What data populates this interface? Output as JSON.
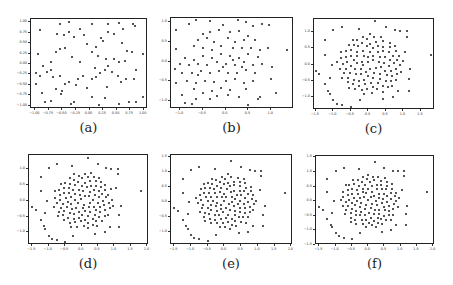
{
  "chart_data": [
    {
      "id": "a",
      "caption": "(a)",
      "type": "scatter",
      "box": {
        "left": 30,
        "top": 18,
        "right": 147,
        "bottom": 108
      },
      "xlim": [
        -1.08,
        1.08
      ],
      "ylim": [
        -1.08,
        1.08
      ],
      "xticks": [
        -1.0,
        -0.75,
        -0.5,
        -0.25,
        0.0,
        0.25,
        0.5,
        0.75,
        1.0
      ],
      "xtick_labels": [
        "−1.00",
        "−0.75",
        "−0.50",
        "−0.25",
        "0.00",
        "0.25",
        "0.50",
        "0.75",
        "1.00"
      ],
      "yticks": [
        1.0,
        0.75,
        0.5,
        0.25,
        0.0,
        -0.25,
        -0.5,
        -0.75,
        -1.0
      ],
      "ytick_labels": [
        "1.00",
        "0.75",
        "0.50",
        "0.25",
        "0.00",
        "−0.25",
        "−0.50",
        "−0.75",
        "−1.00"
      ],
      "points": [
        [
          -0.92,
          0.82
        ],
        [
          -0.55,
          0.95
        ],
        [
          -0.38,
          1.0
        ],
        [
          -0.18,
          0.83
        ],
        [
          0.05,
          0.97
        ],
        [
          0.35,
          0.97
        ],
        [
          0.55,
          0.98
        ],
        [
          0.62,
          0.84
        ],
        [
          0.8,
          0.95
        ],
        [
          0.84,
          0.92
        ],
        [
          -0.6,
          0.72
        ],
        [
          -0.48,
          0.7
        ],
        [
          -0.38,
          0.78
        ],
        [
          -0.28,
          0.65
        ],
        [
          -0.05,
          0.48
        ],
        [
          0.12,
          0.42
        ],
        [
          0.25,
          0.55
        ],
        [
          0.35,
          0.78
        ],
        [
          0.45,
          0.72
        ],
        [
          0.6,
          0.5
        ],
        [
          0.7,
          0.32
        ],
        [
          -0.95,
          0.25
        ],
        [
          -0.62,
          0.3
        ],
        [
          -0.55,
          0.35
        ],
        [
          -0.45,
          0.38
        ],
        [
          -0.32,
          0.18
        ],
        [
          -0.18,
          0.05
        ],
        [
          0.05,
          0.28
        ],
        [
          0.15,
          0.2
        ],
        [
          0.3,
          0.12
        ],
        [
          0.45,
          0.12
        ],
        [
          0.55,
          0.05
        ],
        [
          0.65,
          0.08
        ],
        [
          0.78,
          0.28
        ],
        [
          0.98,
          0.25
        ],
        [
          -0.98,
          -0.22
        ],
        [
          -0.92,
          -0.28
        ],
        [
          -0.85,
          -0.05
        ],
        [
          -0.78,
          -0.2
        ],
        [
          -0.72,
          -0.15
        ],
        [
          -0.68,
          -0.32
        ],
        [
          -0.55,
          -0.28
        ],
        [
          -0.45,
          -0.48
        ],
        [
          -0.38,
          -0.42
        ],
        [
          -0.22,
          -0.35
        ],
        [
          -0.12,
          -0.28
        ],
        [
          0.05,
          -0.35
        ],
        [
          0.12,
          -0.3
        ],
        [
          0.2,
          -0.22
        ],
        [
          0.28,
          -0.15
        ],
        [
          0.35,
          -0.05
        ],
        [
          0.42,
          -0.18
        ],
        [
          0.52,
          -0.28
        ],
        [
          0.58,
          -0.42
        ],
        [
          0.68,
          -0.35
        ],
        [
          0.82,
          -0.35
        ],
        [
          -0.98,
          -0.48
        ],
        [
          -0.88,
          -0.7
        ],
        [
          -0.82,
          -0.92
        ],
        [
          -0.72,
          -0.88
        ],
        [
          -0.62,
          -0.6
        ],
        [
          -0.52,
          -0.72
        ],
        [
          -0.35,
          -0.95
        ],
        [
          -0.28,
          -0.9
        ],
        [
          -0.05,
          -0.58
        ],
        [
          0.05,
          -0.78
        ],
        [
          0.18,
          -0.98
        ],
        [
          0.28,
          -0.82
        ],
        [
          0.32,
          -0.55
        ],
        [
          0.55,
          -0.95
        ],
        [
          0.72,
          -0.92
        ],
        [
          0.85,
          -0.9
        ],
        [
          0.98,
          -0.78
        ],
        [
          -0.5,
          -0.65
        ],
        [
          -0.25,
          -0.5
        ],
        [
          0.1,
          -0.1
        ],
        [
          0.22,
          0.62
        ],
        [
          -0.1,
          0.7
        ],
        [
          -0.72,
          0.05
        ],
        [
          0.85,
          -0.15
        ]
      ]
    },
    {
      "id": "b",
      "caption": "(b)",
      "type": "scatter",
      "box": {
        "left": 170,
        "top": 17,
        "right": 293,
        "bottom": 108
      },
      "xlim": [
        -1.2,
        1.5
      ],
      "ylim": [
        -1.2,
        1.1
      ],
      "xticks": [
        -1.0,
        -0.5,
        0.0,
        0.5,
        1.0
      ],
      "xtick_labels": [
        "−1.0",
        "−0.5",
        "0.0",
        "0.5",
        "1.0"
      ],
      "yticks": [
        1.0,
        0.5,
        0.0,
        -0.5,
        -1.0
      ],
      "ytick_labels": [
        "1.0",
        "0.5",
        "0.0",
        "−0.5",
        "−1.0"
      ],
      "points": [
        [
          -1.1,
          0.8
        ],
        [
          -0.8,
          0.95
        ],
        [
          -0.65,
          1.05
        ],
        [
          -0.35,
          1.02
        ],
        [
          -0.05,
          0.92
        ],
        [
          0.28,
          1.05
        ],
        [
          0.45,
          1.0
        ],
        [
          0.6,
          0.9
        ],
        [
          0.8,
          0.95
        ],
        [
          0.95,
          0.92
        ],
        [
          -0.5,
          0.7
        ],
        [
          -0.35,
          0.75
        ],
        [
          -0.15,
          0.8
        ],
        [
          0.1,
          0.75
        ],
        [
          0.3,
          0.78
        ],
        [
          0.5,
          0.65
        ],
        [
          -0.6,
          0.55
        ],
        [
          -0.4,
          0.6
        ],
        [
          -0.25,
          0.5
        ],
        [
          0.05,
          0.6
        ],
        [
          0.2,
          0.5
        ],
        [
          0.4,
          0.55
        ],
        [
          0.65,
          0.55
        ],
        [
          -1.1,
          0.32
        ],
        [
          -0.7,
          0.4
        ],
        [
          -0.5,
          0.35
        ],
        [
          -0.3,
          0.3
        ],
        [
          -0.1,
          0.4
        ],
        [
          0.15,
          0.35
        ],
        [
          0.35,
          0.35
        ],
        [
          0.55,
          0.35
        ],
        [
          0.75,
          0.3
        ],
        [
          0.92,
          0.35
        ],
        [
          1.35,
          0.28
        ],
        [
          -0.9,
          0.1
        ],
        [
          -0.7,
          0.05
        ],
        [
          -0.5,
          0.15
        ],
        [
          -0.3,
          0.1
        ],
        [
          -0.1,
          0.18
        ],
        [
          0.1,
          0.15
        ],
        [
          0.3,
          0.1
        ],
        [
          0.5,
          0.18
        ],
        [
          0.7,
          0.12
        ],
        [
          -1.0,
          -0.05
        ],
        [
          -0.8,
          -0.1
        ],
        [
          -0.6,
          -0.05
        ],
        [
          -0.4,
          -0.1
        ],
        [
          -0.2,
          -0.02
        ],
        [
          0.0,
          -0.05
        ],
        [
          0.2,
          -0.08
        ],
        [
          0.4,
          -0.02
        ],
        [
          0.6,
          -0.1
        ],
        [
          0.8,
          -0.05
        ],
        [
          -1.12,
          -0.2
        ],
        [
          -0.95,
          -0.3
        ],
        [
          -0.75,
          -0.3
        ],
        [
          -0.55,
          -0.25
        ],
        [
          -0.35,
          -0.3
        ],
        [
          -0.15,
          -0.25
        ],
        [
          0.05,
          -0.28
        ],
        [
          0.25,
          -0.3
        ],
        [
          0.45,
          -0.22
        ],
        [
          0.65,
          -0.3
        ],
        [
          1.02,
          -0.15
        ],
        [
          -1.1,
          -0.55
        ],
        [
          -0.85,
          -0.5
        ],
        [
          -0.65,
          -0.55
        ],
        [
          -0.45,
          -0.48
        ],
        [
          -0.25,
          -0.52
        ],
        [
          0.0,
          -0.5
        ],
        [
          0.2,
          -0.45
        ],
        [
          0.4,
          -0.55
        ],
        [
          0.6,
          -0.5
        ],
        [
          1.0,
          -0.45
        ],
        [
          -0.7,
          -0.7
        ],
        [
          -0.5,
          -0.8
        ],
        [
          -0.3,
          -0.75
        ],
        [
          -0.1,
          -0.68
        ],
        [
          0.1,
          -0.72
        ],
        [
          0.45,
          -0.7
        ],
        [
          -0.95,
          -0.85
        ],
        [
          -0.65,
          -0.95
        ],
        [
          -0.35,
          -0.95
        ],
        [
          -0.2,
          -0.88
        ],
        [
          0.05,
          -0.85
        ],
        [
          0.3,
          -0.9
        ],
        [
          0.7,
          -0.95
        ],
        [
          0.75,
          -0.9
        ],
        [
          1.1,
          -0.8
        ],
        [
          -0.9,
          -1.05
        ],
        [
          -0.75,
          -1.08
        ],
        [
          0.5,
          -1.1
        ],
        [
          -0.6,
          -0.35
        ],
        [
          0.15,
          0.05
        ],
        [
          -0.05,
          -0.15
        ],
        [
          0.35,
          -0.15
        ]
      ]
    },
    {
      "id": "c",
      "caption": "(c)",
      "type": "scatter",
      "box": {
        "left": 313,
        "top": 18,
        "right": 434,
        "bottom": 109
      },
      "xlim": [
        -1.55,
        1.9
      ],
      "ylim": [
        -1.4,
        1.4
      ],
      "xticks": [
        -1.5,
        -1.0,
        -0.5,
        0.0,
        0.5,
        1.0,
        1.5
      ],
      "xtick_labels": [
        "−1.5",
        "−1.0",
        "−0.5",
        "0.0",
        "0.5",
        "1.0",
        "1.5"
      ],
      "yticks": [
        1.0,
        0.5,
        0.0,
        -0.5,
        -1.0
      ],
      "ytick_labels": [
        "1.0",
        "0.5",
        "0.0",
        "−0.5",
        "−1.0"
      ],
      "points": []
    },
    {
      "id": "d",
      "caption": "(d)",
      "type": "scatter",
      "box": {
        "left": 28,
        "top": 154,
        "right": 148,
        "bottom": 244
      },
      "xlim": [
        -1.6,
        2.05
      ],
      "ylim": [
        -1.4,
        1.45
      ],
      "xticks": [
        -1.5,
        -1.0,
        -0.5,
        0.0,
        0.5,
        1.0,
        1.5,
        2.0
      ],
      "xtick_labels": [
        "−1.5",
        "−1.0",
        "−0.5",
        "0.0",
        "0.5",
        "1.0",
        "1.5",
        "2.0"
      ],
      "yticks": [
        1.0,
        0.5,
        0.0,
        -0.5,
        -1.0
      ],
      "ytick_labels": [
        "1.0",
        "0.5",
        "0.0",
        "−0.5",
        "−1.0"
      ],
      "points": []
    },
    {
      "id": "e",
      "caption": "(e)",
      "type": "scatter",
      "box": {
        "left": 170,
        "top": 154,
        "right": 292,
        "bottom": 244
      },
      "xlim": [
        -1.6,
        2.05
      ],
      "ylim": [
        -1.45,
        1.55
      ],
      "xticks": [
        -1.5,
        -1.0,
        -0.5,
        0.0,
        0.5,
        1.0,
        1.5,
        2.0
      ],
      "xtick_labels": [
        "−1.5",
        "−1.0",
        "−0.5",
        "0.0",
        "0.5",
        "1.0",
        "1.5",
        "2.0"
      ],
      "yticks": [
        1.5,
        1.0,
        0.5,
        0.0,
        -0.5,
        -1.0
      ],
      "ytick_labels": [
        "1.5",
        "1.0",
        "0.5",
        "0.0",
        "−0.5",
        "−1.0"
      ],
      "points": []
    },
    {
      "id": "f",
      "caption": "(f)",
      "type": "scatter",
      "box": {
        "left": 315,
        "top": 155,
        "right": 434,
        "bottom": 244
      },
      "xlim": [
        -1.6,
        2.05
      ],
      "ylim": [
        -1.5,
        1.55
      ],
      "xticks": [
        -1.5,
        -1.0,
        -0.5,
        0.0,
        0.5,
        1.0,
        1.5,
        2.0
      ],
      "xtick_labels": [
        "−1.5",
        "−1.0",
        "−0.5",
        "0.0",
        "0.5",
        "1.0",
        "1.5",
        "2.0"
      ],
      "yticks": [
        1.5,
        1.0,
        0.5,
        0.0,
        -0.5,
        -1.0,
        -1.5
      ],
      "ytick_labels": [
        "1.5",
        "1.0",
        "0.5",
        "0.0",
        "−0.5",
        "−1.0",
        "−1.5"
      ],
      "points": []
    }
  ],
  "spiral_template": {
    "note_visible": false,
    "outer": [
      [
        -1.25,
        0.75
      ],
      [
        -1.0,
        1.05
      ],
      [
        -0.75,
        1.15
      ],
      [
        -0.28,
        1.1
      ],
      [
        0.2,
        1.35
      ],
      [
        0.5,
        1.15
      ],
      [
        0.75,
        1.05
      ],
      [
        0.9,
        1.02
      ],
      [
        1.1,
        1.02
      ],
      [
        1.1,
        0.85
      ],
      [
        1.05,
        0.4
      ],
      [
        1.2,
        -0.15
      ],
      [
        1.15,
        -0.45
      ],
      [
        1.15,
        -0.82
      ],
      [
        0.85,
        -0.82
      ],
      [
        0.7,
        -1.0
      ],
      [
        0.42,
        -1.05
      ],
      [
        -0.25,
        -1.1
      ],
      [
        -0.5,
        -1.3
      ],
      [
        -0.75,
        -1.25
      ],
      [
        -0.9,
        -1.2
      ],
      [
        -1.0,
        -1.1
      ],
      [
        -1.1,
        -0.9
      ],
      [
        -1.15,
        -0.8
      ],
      [
        -1.25,
        -0.6
      ],
      [
        -1.4,
        -0.3
      ],
      [
        -1.5,
        -0.2
      ],
      [
        -1.25,
        0.3
      ],
      [
        -1.05,
        0.0
      ],
      [
        -1.1,
        -0.4
      ],
      [
        1.8,
        0.3
      ]
    ],
    "inner_rings": 6
  },
  "figure": {
    "captions": [
      "(a)",
      "(b)",
      "(c)",
      "(d)",
      "(e)",
      "(f)"
    ]
  }
}
